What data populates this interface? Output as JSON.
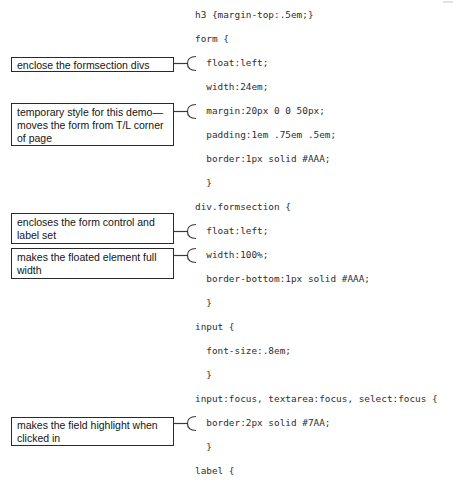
{
  "code": {
    "lines": [
      "h3 {margin-top:.5em;}",
      "form {",
      "  float:left;",
      "  width:24em;",
      "  margin:20px 0 0 50px;",
      "  padding:1em .75em .5em;",
      "  border:1px solid #AAA;",
      "  }",
      "div.formsection {",
      "  float:left;",
      "  width:100%;",
      "  border-bottom:1px solid #AAA;",
      "  }",
      "input {",
      "  font-size:.8em;",
      "  }",
      "input:focus, textarea:focus, select:focus {",
      "  border:2px solid #7AA;",
      "  }",
      "label {"
    ]
  },
  "annotations": [
    {
      "lines": [
        "enclose the formsection divs"
      ],
      "target_code": "float:left;"
    },
    {
      "lines": [
        "temporary style for this demo—",
        "moves the form from T/L corner",
        "of page"
      ],
      "target_code": "margin:20px 0 0 50px;"
    },
    {
      "lines": [
        "encloses the form control and",
        "label set"
      ],
      "target_code": "float:left;"
    },
    {
      "lines": [
        "makes the floated element full",
        "width"
      ],
      "target_code": "width:100%;"
    },
    {
      "lines": [
        "makes the field highlight when",
        "clicked in"
      ],
      "target_code": "border:2px solid #7AA;"
    }
  ],
  "colors": {
    "page_background": "#ffffff",
    "code_text": "#2e2e2e",
    "annotation_border": "#2a2a2a",
    "annotation_text": "#141414",
    "bracket_stroke": "#3a3a3a"
  }
}
